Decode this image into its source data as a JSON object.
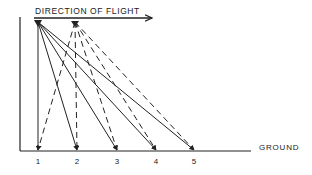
{
  "title": "DIRECTION OF FLIGHT",
  "ground_label": "GROUND",
  "points": [
    {
      "label": "1",
      "x": 38
    },
    {
      "label": "2",
      "x": 77
    },
    {
      "label": "3",
      "x": 117
    },
    {
      "label": "4",
      "x": 156
    },
    {
      "label": "5",
      "x": 194
    }
  ],
  "source_solid": {
    "x": 38,
    "y": 22
  },
  "source_dashed": {
    "x": 75,
    "y": 22
  },
  "colors": {
    "ink": "#222222",
    "background": "#ffffff"
  }
}
